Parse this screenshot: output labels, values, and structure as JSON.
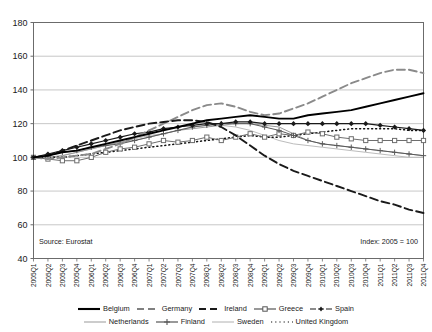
{
  "source_note": "Source: Eurostat",
  "index_note": "Index: 2005 = 100",
  "axis": {
    "y_ticks": [
      "40",
      "60",
      "80",
      "100",
      "120",
      "140",
      "160",
      "180"
    ],
    "x_ticks": [
      "2005Q1",
      "2005Q2",
      "2005Q3",
      "2005Q4",
      "2006Q1",
      "2006Q2",
      "2006Q3",
      "2006Q4",
      "2007Q1",
      "2007Q2",
      "2007Q3",
      "2007Q4",
      "2008Q1",
      "2008Q2",
      "2008Q3",
      "2008Q4",
      "2009Q1",
      "2009Q2",
      "2009Q3",
      "2009Q4",
      "2010Q1",
      "2010Q2",
      "2010Q3",
      "2010Q4",
      "2011Q1",
      "2011Q2",
      "2011Q3",
      "2011Q4"
    ]
  },
  "legend": {
    "row1": [
      {
        "label": "Belgium",
        "style": "solid-thick-black",
        "color": "#000000"
      },
      {
        "label": "Germany",
        "style": "long-dash-gray",
        "color": "#808080"
      },
      {
        "label": "Ireland",
        "style": "long-dash-black",
        "color": "#1a1a1a"
      },
      {
        "label": "Greece",
        "style": "line-square-marker",
        "color": "#555555"
      },
      {
        "label": "Spain",
        "style": "dash-dot-black",
        "color": "#1a1a1a"
      }
    ],
    "row2": [
      {
        "label": "Netherlands",
        "style": "solid-thin-gray",
        "color": "#999999"
      },
      {
        "label": "Finland",
        "style": "line-plus-marker",
        "color": "#555555"
      },
      {
        "label": "Sweden",
        "style": "solid-thin-lightgray",
        "color": "#b0b0b0"
      },
      {
        "label": "United Kingdom",
        "style": "dotted-black",
        "color": "#111111"
      }
    ]
  },
  "chart_data": {
    "type": "line",
    "title": "",
    "subtitle": "",
    "xlabel": "",
    "ylabel": "",
    "ylim": [
      40,
      180
    ],
    "ytick_step": 20,
    "grid": "horizontal",
    "legend_position": "bottom",
    "annotations": [
      "Source: Eurostat",
      "Index: 2005 = 100"
    ],
    "x": [
      "2005Q1",
      "2005Q2",
      "2005Q3",
      "2005Q4",
      "2006Q1",
      "2006Q2",
      "2006Q3",
      "2006Q4",
      "2007Q1",
      "2007Q2",
      "2007Q3",
      "2007Q4",
      "2008Q1",
      "2008Q2",
      "2008Q3",
      "2008Q4",
      "2009Q1",
      "2009Q2",
      "2009Q3",
      "2009Q4",
      "2010Q1",
      "2010Q2",
      "2010Q3",
      "2010Q4",
      "2011Q1",
      "2011Q2",
      "2011Q3",
      "2011Q4"
    ],
    "series": [
      {
        "name": "Belgium",
        "values": [
          100,
          101,
          103,
          104,
          106,
          108,
          110,
          112,
          114,
          116,
          118,
          120,
          122,
          123,
          124,
          125,
          124,
          123,
          123,
          125,
          126,
          127,
          128,
          130,
          132,
          134,
          136,
          138
        ]
      },
      {
        "name": "Germany",
        "values": [
          100,
          99,
          100,
          101,
          102,
          105,
          108,
          112,
          116,
          120,
          124,
          128,
          131,
          132,
          130,
          127,
          125,
          126,
          129,
          132,
          136,
          140,
          144,
          147,
          150,
          152,
          152,
          150
        ]
      },
      {
        "name": "Ireland",
        "values": [
          100,
          101,
          104,
          107,
          110,
          113,
          116,
          118,
          120,
          121,
          122,
          122,
          121,
          118,
          113,
          107,
          101,
          96,
          92,
          89,
          86,
          83,
          80,
          77,
          74,
          72,
          69,
          67
        ]
      },
      {
        "name": "Greece",
        "values": [
          100,
          99,
          98,
          98,
          100,
          103,
          105,
          106,
          108,
          110,
          109,
          110,
          112,
          110,
          112,
          114,
          112,
          114,
          113,
          115,
          114,
          112,
          111,
          110,
          110,
          110,
          110,
          110
        ]
      },
      {
        "name": "Spain",
        "values": [
          100,
          102,
          104,
          106,
          108,
          110,
          112,
          114,
          115,
          117,
          118,
          119,
          120,
          120,
          121,
          121,
          120,
          120,
          120,
          120,
          120,
          120,
          120,
          120,
          119,
          118,
          117,
          116
        ]
      },
      {
        "name": "Netherlands",
        "values": [
          100,
          100,
          101,
          103,
          105,
          107,
          109,
          110,
          112,
          114,
          116,
          117,
          118,
          119,
          120,
          120,
          119,
          118,
          114,
          110,
          108,
          107,
          106,
          105,
          104,
          103,
          102,
          101
        ]
      },
      {
        "name": "Finland",
        "values": [
          100,
          101,
          103,
          104,
          106,
          107,
          108,
          110,
          112,
          114,
          116,
          118,
          119,
          120,
          120,
          120,
          118,
          116,
          113,
          110,
          108,
          107,
          106,
          105,
          104,
          103,
          102,
          101
        ]
      },
      {
        "name": "Sweden",
        "values": [
          100,
          100,
          101,
          103,
          105,
          107,
          109,
          111,
          113,
          114,
          116,
          118,
          119,
          119,
          118,
          116,
          113,
          110,
          108,
          107,
          106,
          105,
          104,
          103,
          102,
          101,
          100,
          100
        ]
      },
      {
        "name": "United Kingdom",
        "values": [
          100,
          100,
          100,
          101,
          102,
          103,
          104,
          105,
          106,
          107,
          108,
          109,
          110,
          111,
          112,
          113,
          112,
          112,
          113,
          114,
          115,
          116,
          117,
          117,
          117,
          117,
          116,
          116
        ]
      }
    ]
  }
}
